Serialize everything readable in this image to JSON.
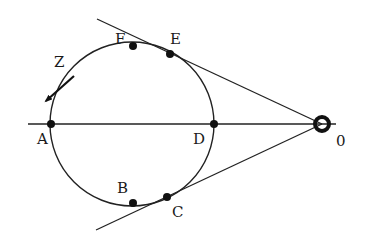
{
  "figure": {
    "width": 366,
    "height": 249,
    "colors": {
      "line": "#222222",
      "point": "#111111",
      "text": "#1a1a1a",
      "background": "#ffffff"
    },
    "circle": {
      "cx": 132,
      "cy": 124,
      "r": 82
    },
    "axis_line": {
      "x1": 28,
      "y1": 124,
      "x2": 336,
      "y2": 124
    },
    "tangent_upper": {
      "x1": 97,
      "y1": 19,
      "x2": 322,
      "y2": 124
    },
    "tangent_lower": {
      "x1": 96,
      "y1": 230,
      "x2": 322,
      "y2": 124
    },
    "source": {
      "name": "O",
      "label": "0",
      "x": 322,
      "y": 124,
      "label_x": 336,
      "label_y": 146
    },
    "points": [
      {
        "name": "A",
        "label": "A",
        "x": 51,
        "y": 124,
        "label_x": 37,
        "label_y": 144
      },
      {
        "name": "D",
        "label": "D",
        "x": 214,
        "y": 124,
        "label_x": 193,
        "label_y": 144
      },
      {
        "name": "E",
        "label": "E",
        "x": 170,
        "y": 54,
        "label_x": 170,
        "label_y": 44
      },
      {
        "name": "F",
        "label": "F",
        "x": 133,
        "y": 46,
        "label_x": 115,
        "label_y": 44
      },
      {
        "name": "B",
        "label": "B",
        "x": 133,
        "y": 203,
        "label_x": 117,
        "label_y": 193
      },
      {
        "name": "C",
        "label": "C",
        "x": 167,
        "y": 197,
        "label_x": 172,
        "label_y": 217
      }
    ],
    "direction_arrow": {
      "label": "Z",
      "label_x": 54,
      "label_y": 67,
      "x1": 74,
      "y1": 76,
      "x2": 46,
      "y2": 101
    }
  }
}
